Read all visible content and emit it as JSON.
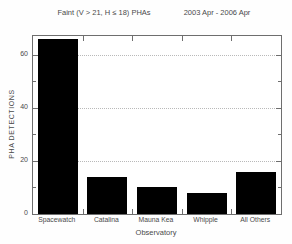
{
  "header": {
    "title_left": "Faint (V > 21, H ≤ 18) PHAs",
    "title_right": "2003 Apr - 2006 Apr"
  },
  "chart_data": {
    "type": "bar",
    "title": "Faint (V > 21, H ≤ 18) PHAs",
    "subtitle_right": "2003 Apr - 2006 Apr",
    "categories": [
      "Spacewatch",
      "Catalina",
      "Mauna Kea",
      "Whipple",
      "All Others"
    ],
    "values": [
      66,
      14,
      10,
      8,
      16
    ],
    "xlabel": "Observatory",
    "ylabel": "PHA DETECTIONS",
    "ylim": [
      0,
      67
    ],
    "yticks": [
      0,
      20,
      40,
      60
    ],
    "minor_tick_step": 10,
    "grid": "horizontal dotted lines at major y ticks",
    "legend_position": "none",
    "bar_color": "#000000",
    "background_color": "#ffffff",
    "frame_color": "#6e6e6e"
  }
}
